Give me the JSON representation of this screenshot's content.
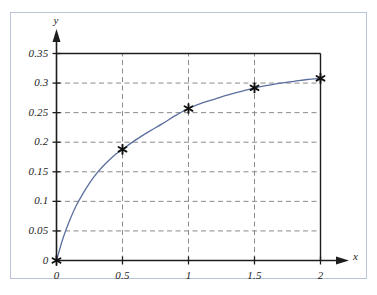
{
  "chart_data": {
    "type": "line",
    "title": "",
    "subtitle": "",
    "xlabel": "x",
    "ylabel": "y",
    "xlim": [
      0,
      2
    ],
    "ylim": [
      0,
      0.35
    ],
    "grid": true,
    "legend": null,
    "xticks": [
      "0",
      "0.5",
      "1",
      "1.5",
      "2"
    ],
    "xtick_values": [
      0,
      0.5,
      1,
      1.5,
      2
    ],
    "yticks": [
      "0",
      "0.05",
      "0.1",
      "0.15",
      "0.2",
      "0.25",
      "0.3",
      "0.35"
    ],
    "ytick_values": [
      0,
      0.05,
      0.1,
      0.15,
      0.2,
      0.25,
      0.3,
      0.35
    ],
    "series": [
      {
        "name": "curve",
        "color": "#5b6f9e",
        "marker": "asterisk",
        "marker_color": "#101010",
        "x": [
          0,
          0.5,
          1,
          1.5,
          2
        ],
        "values": [
          0,
          0.188,
          0.257,
          0.292,
          0.308
        ]
      }
    ],
    "curve_points": {
      "x": [
        0,
        0.05,
        0.1,
        0.15,
        0.2,
        0.25,
        0.3,
        0.35,
        0.4,
        0.45,
        0.5,
        0.6,
        0.7,
        0.8,
        0.9,
        1.0,
        1.1,
        1.2,
        1.3,
        1.4,
        1.5,
        1.6,
        1.7,
        1.8,
        1.9,
        2.0
      ],
      "y": [
        0,
        0.038,
        0.068,
        0.093,
        0.113,
        0.131,
        0.146,
        0.159,
        0.17,
        0.18,
        0.188,
        0.204,
        0.218,
        0.231,
        0.245,
        0.257,
        0.266,
        0.273,
        0.28,
        0.286,
        0.292,
        0.296,
        0.3,
        0.303,
        0.306,
        0.308
      ]
    }
  },
  "axes": {
    "y_axis_name": "y",
    "x_axis_name": "x"
  },
  "colors": {
    "curve": "#5b6f9e",
    "axis": "#1d1d1d",
    "grid": "#8a8a8a",
    "frame": "#b9c4d8"
  }
}
